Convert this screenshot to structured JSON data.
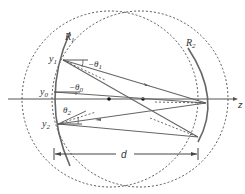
{
  "diagram": {
    "labels": {
      "mirror1": "R",
      "mirror1_sub": "1",
      "mirror2": "R",
      "mirror2_sub": "2",
      "y1": "y",
      "y1_sub": "1",
      "y0": "y",
      "y0_sub": "0",
      "y2": "y",
      "y2_sub": "2",
      "theta1": "−θ",
      "theta1_sub": "1",
      "theta0": "−θ",
      "theta0_sub": "0",
      "theta2": "θ",
      "theta2_sub": "2",
      "axis": "z",
      "distance": "d"
    },
    "colors": {
      "line": "#555555",
      "mirror": "#666666",
      "dashed": "#444444",
      "text": "#333333"
    }
  }
}
